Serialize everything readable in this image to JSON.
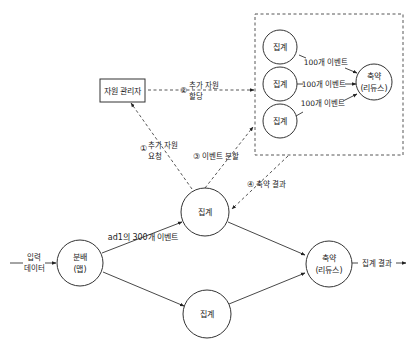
{
  "diagram": {
    "nodes": {
      "resource_manager": "자원 관리자",
      "map_line1": "분배",
      "map_line2": "(맵)",
      "agg_top": "집계",
      "agg_bottom": "집계",
      "reduce_main_line1": "축약",
      "reduce_main_line2": "(리듀스)",
      "cluster_agg_1": "집계",
      "cluster_agg_2": "집계",
      "cluster_agg_3": "집계",
      "cluster_reduce_line1": "축약",
      "cluster_reduce_line2": "(리듀스)"
    },
    "labels": {
      "input_line1": "입력",
      "input_line2": "데이터",
      "ad_events": "ad1의 300개 이벤트",
      "output": "집계 결과",
      "events_100_a": "100개 이벤트",
      "events_100_b": "100개 이벤트",
      "events_100_c": "100개 이벤트"
    },
    "steps": [
      {
        "num": "①",
        "line1": "추가 자원",
        "line2": "요청"
      },
      {
        "num": "②",
        "line1": "추가 자원",
        "line2": "할당"
      },
      {
        "num": "③",
        "line1": "이벤트 분할",
        "line2": ""
      },
      {
        "num": "④",
        "line1": "축약 결과",
        "line2": ""
      }
    ]
  }
}
